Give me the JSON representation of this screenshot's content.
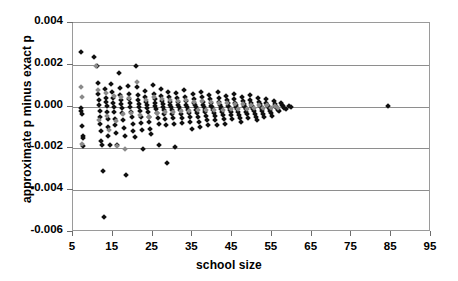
{
  "chart_data": {
    "type": "scatter",
    "title": "",
    "xlabel": "school size",
    "ylabel": "approximate p minus exact p",
    "xlim": [
      5,
      95
    ],
    "ylim": [
      -0.006,
      0.004
    ],
    "xticks": [
      5,
      15,
      25,
      35,
      45,
      55,
      65,
      75,
      85,
      95
    ],
    "xtick_labels": [
      "5",
      "15",
      "25",
      "35",
      "45",
      "55",
      "65",
      "75",
      "85",
      "95"
    ],
    "yticks": [
      0.004,
      0.002,
      0.0,
      -0.002,
      -0.004,
      -0.006
    ],
    "ytick_labels": [
      "0.004",
      "0.002",
      "0.000",
      "-0.002",
      "-0.004",
      "-0.006"
    ],
    "grid": "horizontal",
    "legend": "none",
    "marker": "diamond",
    "colors": {
      "series1": "#101010",
      "series2": "#8a8a8a",
      "axis": "#9a9a9a",
      "gridline": "#8e8e8e"
    },
    "series": [
      {
        "name": "black diamonds",
        "color": "#101010",
        "points": [
          [
            7.0,
            0.00262
          ],
          [
            7.1,
            -8e-05
          ],
          [
            7.1,
            -0.00022
          ],
          [
            7.2,
            -0.00035
          ],
          [
            7.3,
            -0.00095
          ],
          [
            7.4,
            -0.0014
          ],
          [
            7.4,
            -0.00152
          ],
          [
            7.5,
            -0.0019
          ],
          [
            10.4,
            0.00239
          ],
          [
            11.0,
            0.00196
          ],
          [
            11.2,
            0.00112
          ],
          [
            11.4,
            0.00058
          ],
          [
            11.5,
            0.0003
          ],
          [
            11.6,
            6e-05
          ],
          [
            11.7,
            -0.0002
          ],
          [
            11.8,
            -0.00052
          ],
          [
            11.9,
            -0.00082
          ],
          [
            12.0,
            -0.00118
          ],
          [
            12.1,
            -0.00163
          ],
          [
            12.2,
            -0.00186
          ],
          [
            12.6,
            -0.0031
          ],
          [
            12.8,
            -0.00528
          ],
          [
            13.1,
            0.00084
          ],
          [
            13.3,
            0.00042
          ],
          [
            13.4,
            0.00022
          ],
          [
            13.5,
            2e-05
          ],
          [
            13.6,
            -0.00028
          ],
          [
            13.7,
            -0.0006
          ],
          [
            13.8,
            -0.00098
          ],
          [
            13.9,
            -0.00139
          ],
          [
            14.2,
            -0.00186
          ],
          [
            14.6,
            0.0011
          ],
          [
            14.8,
            0.0007
          ],
          [
            15.0,
            0.0004
          ],
          [
            15.1,
            0.00018
          ],
          [
            15.2,
            -2e-05
          ],
          [
            15.3,
            -0.00025
          ],
          [
            15.5,
            -0.00058
          ],
          [
            15.6,
            -0.0009
          ],
          [
            15.8,
            -0.00128
          ],
          [
            16.0,
            -0.00185
          ],
          [
            16.5,
            0.00161
          ],
          [
            16.7,
            0.0009
          ],
          [
            16.9,
            0.00055
          ],
          [
            17.0,
            0.0003
          ],
          [
            17.1,
            0.00012
          ],
          [
            17.2,
            -5e-05
          ],
          [
            17.4,
            -0.00032
          ],
          [
            17.6,
            -0.00065
          ],
          [
            17.8,
            -0.001
          ],
          [
            18.0,
            -0.00142
          ],
          [
            18.3,
            -0.00325
          ],
          [
            18.8,
            0.00098
          ],
          [
            19.0,
            0.0006
          ],
          [
            19.2,
            0.00035
          ],
          [
            19.3,
            0.00015
          ],
          [
            19.4,
            -2e-05
          ],
          [
            19.6,
            -0.00024
          ],
          [
            19.8,
            -0.0005
          ],
          [
            20.0,
            -0.00082
          ],
          [
            20.2,
            -0.00118
          ],
          [
            20.5,
            -0.00147
          ],
          [
            20.9,
            0.00196
          ],
          [
            21.1,
            0.00092
          ],
          [
            21.3,
            0.00056
          ],
          [
            21.4,
            0.0003
          ],
          [
            21.5,
            0.00012
          ],
          [
            21.6,
            -3e-05
          ],
          [
            21.8,
            -0.00022
          ],
          [
            22.0,
            -0.00048
          ],
          [
            22.2,
            -0.00078
          ],
          [
            22.4,
            -0.00112
          ],
          [
            22.6,
            -0.00203
          ],
          [
            23.0,
            0.00074
          ],
          [
            23.2,
            0.00046
          ],
          [
            23.4,
            0.00024
          ],
          [
            23.5,
            8e-05
          ],
          [
            23.6,
            -6e-05
          ],
          [
            23.8,
            -0.00025
          ],
          [
            24.0,
            -0.00048
          ],
          [
            24.2,
            -0.00075
          ],
          [
            24.4,
            -0.00108
          ],
          [
            24.7,
            -0.0013
          ],
          [
            25.1,
            0.00102
          ],
          [
            25.3,
            0.00062
          ],
          [
            25.5,
            0.00034
          ],
          [
            25.6,
            0.00015
          ],
          [
            25.7,
            2e-05
          ],
          [
            25.9,
            -0.00012
          ],
          [
            26.1,
            -0.0003
          ],
          [
            26.3,
            -0.00055
          ],
          [
            26.5,
            -0.00085
          ],
          [
            26.7,
            -0.00185
          ],
          [
            27.0,
            0.00086
          ],
          [
            27.2,
            0.00052
          ],
          [
            27.4,
            0.00028
          ],
          [
            27.5,
            0.00011
          ],
          [
            27.6,
            -1e-05
          ],
          [
            27.8,
            -0.00015
          ],
          [
            28.0,
            -0.00034
          ],
          [
            28.2,
            -0.00058
          ],
          [
            28.4,
            -0.00088
          ],
          [
            28.6,
            -0.0027
          ],
          [
            29.0,
            0.0007
          ],
          [
            29.2,
            0.00044
          ],
          [
            29.4,
            0.00023
          ],
          [
            29.5,
            8e-05
          ],
          [
            29.6,
            -3e-05
          ],
          [
            29.8,
            -0.00016
          ],
          [
            30.0,
            -0.00034
          ],
          [
            30.2,
            -0.00056
          ],
          [
            30.4,
            -0.00084
          ],
          [
            30.6,
            -0.00195
          ],
          [
            31.0,
            0.00065
          ],
          [
            31.2,
            0.0004
          ],
          [
            31.4,
            0.00021
          ],
          [
            31.5,
            7e-05
          ],
          [
            31.7,
            -4e-05
          ],
          [
            31.9,
            -0.00018
          ],
          [
            32.1,
            -0.00034
          ],
          [
            32.3,
            -0.00055
          ],
          [
            32.5,
            -0.0008
          ],
          [
            33.0,
            0.00078
          ],
          [
            33.2,
            0.00047
          ],
          [
            33.4,
            0.00025
          ],
          [
            33.5,
            9e-05
          ],
          [
            33.7,
            -2e-05
          ],
          [
            33.9,
            -0.00015
          ],
          [
            34.1,
            -0.00031
          ],
          [
            34.3,
            -0.0005
          ],
          [
            34.5,
            -0.00074
          ],
          [
            34.8,
            -0.00106
          ],
          [
            35.1,
            0.0006
          ],
          [
            35.3,
            0.00037
          ],
          [
            35.5,
            0.00019
          ],
          [
            35.6,
            6e-05
          ],
          [
            35.8,
            -4e-05
          ],
          [
            36.0,
            -0.00016
          ],
          [
            36.2,
            -0.00031
          ],
          [
            36.4,
            -0.0005
          ],
          [
            36.6,
            -0.00072
          ],
          [
            36.9,
            -0.00098
          ],
          [
            37.2,
            0.00072
          ],
          [
            37.4,
            0.00044
          ],
          [
            37.6,
            0.00023
          ],
          [
            37.7,
            8e-05
          ],
          [
            37.9,
            -2e-05
          ],
          [
            38.1,
            -0.00014
          ],
          [
            38.3,
            -0.00028
          ],
          [
            38.5,
            -0.00045
          ],
          [
            38.7,
            -0.00066
          ],
          [
            39.0,
            -0.0009
          ],
          [
            39.3,
            0.00056
          ],
          [
            39.5,
            0.00034
          ],
          [
            39.7,
            0.00017
          ],
          [
            39.8,
            5e-05
          ],
          [
            40.0,
            -4e-05
          ],
          [
            40.2,
            -0.00015
          ],
          [
            40.4,
            -0.00029
          ],
          [
            40.6,
            -0.00046
          ],
          [
            40.8,
            -0.00066
          ],
          [
            41.1,
            -0.00086
          ],
          [
            41.4,
            0.00068
          ],
          [
            41.6,
            0.00041
          ],
          [
            41.8,
            0.00021
          ],
          [
            41.9,
            7e-05
          ],
          [
            42.1,
            -2e-05
          ],
          [
            42.3,
            -0.00013
          ],
          [
            42.5,
            -0.00026
          ],
          [
            42.7,
            -0.00041
          ],
          [
            42.9,
            -0.0006
          ],
          [
            43.2,
            -0.00082
          ],
          [
            43.5,
            0.0005
          ],
          [
            43.7,
            0.0003
          ],
          [
            43.9,
            0.00015
          ],
          [
            44.0,
            4e-05
          ],
          [
            44.2,
            -4e-05
          ],
          [
            44.4,
            -0.00014
          ],
          [
            44.6,
            -0.00026
          ],
          [
            44.8,
            -0.00041
          ],
          [
            45.0,
            -0.00058
          ],
          [
            45.4,
            0.00062
          ],
          [
            45.6,
            0.00038
          ],
          [
            45.8,
            0.00019
          ],
          [
            45.9,
            6e-05
          ],
          [
            46.1,
            -2e-05
          ],
          [
            46.3,
            -0.00012
          ],
          [
            46.5,
            -0.00024
          ],
          [
            46.7,
            -0.00038
          ],
          [
            46.9,
            -0.00055
          ],
          [
            47.2,
            -0.00074
          ],
          [
            47.5,
            0.00046
          ],
          [
            47.7,
            0.00027
          ],
          [
            47.9,
            0.00013
          ],
          [
            48.0,
            3e-05
          ],
          [
            48.2,
            -4e-05
          ],
          [
            48.4,
            -0.00013
          ],
          [
            48.6,
            -0.00024
          ],
          [
            48.8,
            -0.00037
          ],
          [
            49.0,
            -0.00053
          ],
          [
            49.4,
            0.00054
          ],
          [
            49.6,
            0.00032
          ],
          [
            49.8,
            0.00016
          ],
          [
            49.9,
            5e-05
          ],
          [
            50.1,
            -2e-05
          ],
          [
            50.3,
            -0.00011
          ],
          [
            50.5,
            -0.00021
          ],
          [
            50.7,
            -0.00034
          ],
          [
            50.9,
            -0.00049
          ],
          [
            51.2,
            -0.00066
          ],
          [
            51.5,
            0.0004
          ],
          [
            51.7,
            0.00024
          ],
          [
            51.9,
            0.00011
          ],
          [
            52.0,
            2e-05
          ],
          [
            52.2,
            -4e-05
          ],
          [
            52.4,
            -0.00012
          ],
          [
            52.6,
            -0.00022
          ],
          [
            52.8,
            -0.00034
          ],
          [
            53.0,
            -0.00048
          ],
          [
            53.4,
            0.00034
          ],
          [
            53.6,
            0.00019
          ],
          [
            53.8,
            8e-05
          ],
          [
            54.0,
            1e-05
          ],
          [
            54.2,
            -5e-05
          ],
          [
            54.4,
            -0.00012
          ],
          [
            54.6,
            -0.00021
          ],
          [
            54.8,
            -0.00032
          ],
          [
            55.1,
            -0.00044
          ],
          [
            55.5,
            0.00026
          ],
          [
            55.7,
            0.00014
          ],
          [
            55.9,
            5e-05
          ],
          [
            56.1,
            -1e-05
          ],
          [
            56.3,
            -7e-05
          ],
          [
            56.5,
            -0.00014
          ],
          [
            56.8,
            -0.00023
          ],
          [
            57.2,
            0.00018
          ],
          [
            57.5,
            8e-05
          ],
          [
            57.8,
            1e-05
          ],
          [
            58.1,
            -6e-05
          ],
          [
            58.5,
            -0.00013
          ],
          [
            59.2,
            4e-05
          ],
          [
            59.8,
            -2e-05
          ],
          [
            84.2,
            2e-05
          ]
        ]
      },
      {
        "name": "gray diamonds",
        "color": "#8a8a8a",
        "points": [
          [
            7.1,
            0.00092
          ],
          [
            7.2,
            0.00048
          ],
          [
            7.3,
            -0.00178
          ],
          [
            10.9,
            0.00192
          ],
          [
            11.3,
            0.00078
          ],
          [
            11.6,
            -0.00064
          ],
          [
            13.2,
            0.00066
          ],
          [
            13.6,
            -0.00044
          ],
          [
            14.0,
            -0.0011
          ],
          [
            15.2,
            0.00052
          ],
          [
            15.7,
            -0.0007
          ],
          [
            16.1,
            -0.0019
          ],
          [
            17.0,
            0.00046
          ],
          [
            17.5,
            -0.00034
          ],
          [
            18.1,
            -0.00205
          ],
          [
            19.1,
            0.0004
          ],
          [
            19.7,
            -0.0003
          ],
          [
            21.2,
            0.0012
          ],
          [
            21.9,
            -0.0004
          ],
          [
            23.3,
            0.0003
          ],
          [
            24.1,
            -0.0005
          ],
          [
            25.4,
            0.00044
          ],
          [
            26.2,
            -0.0003
          ],
          [
            27.3,
            0.00038
          ],
          [
            28.1,
            -0.00026
          ],
          [
            29.3,
            0.0003
          ],
          [
            30.1,
            -0.00024
          ],
          [
            31.3,
            0.00026
          ],
          [
            32.2,
            -0.00022
          ],
          [
            33.3,
            0.0003
          ],
          [
            34.2,
            -0.0002
          ],
          [
            35.4,
            0.00022
          ],
          [
            36.3,
            -0.00018
          ],
          [
            37.5,
            0.00025
          ],
          [
            38.4,
            -0.00016
          ],
          [
            39.6,
            0.0002
          ],
          [
            40.5,
            -0.00015
          ],
          [
            41.7,
            0.00018
          ],
          [
            42.6,
            -0.00014
          ],
          [
            43.8,
            0.00016
          ],
          [
            44.7,
            -0.00012
          ],
          [
            45.7,
            0.00014
          ],
          [
            46.6,
            -0.00011
          ],
          [
            47.8,
            0.00012
          ],
          [
            48.7,
            -0.0001
          ],
          [
            49.7,
            0.0001
          ],
          [
            50.6,
            -9e-05
          ],
          [
            51.8,
            8e-05
          ],
          [
            52.7,
            -8e-05
          ],
          [
            53.7,
            6e-05
          ],
          [
            54.7,
            -7e-05
          ],
          [
            55.8,
            4e-05
          ],
          [
            56.6,
            -5e-05
          ]
        ]
      }
    ]
  }
}
